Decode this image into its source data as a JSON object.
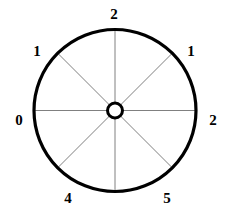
{
  "diagram": {
    "type": "radial-sector-wheel",
    "colors": {
      "background": "#ffffff",
      "outer_circle_stroke": "#000000",
      "spoke_stroke": "#808080",
      "hub_stroke": "#000000",
      "hub_fill": "#ffffff",
      "label_color": "#000000"
    },
    "geometry": {
      "center_x": 115,
      "center_y": 110.5,
      "outer_radius": 81,
      "outer_stroke_width": 3.2,
      "hub_radius": 7.5,
      "hub_stroke_width": 3,
      "spoke_stroke_width": 1,
      "spoke_count": 8,
      "spoke_angles_deg": [
        0,
        45,
        90,
        135,
        180,
        225,
        270,
        315
      ]
    },
    "spokes": [
      {
        "name": "spoke-right",
        "angle_deg": 0,
        "x1": 122.5,
        "y1": 110.5,
        "x2": 196.0,
        "y2": 110.5
      },
      {
        "name": "spoke-upper-right",
        "angle_deg": 45,
        "x1": 120.3,
        "y1": 105.2,
        "x2": 172.3,
        "y2": 53.2
      },
      {
        "name": "spoke-top",
        "angle_deg": 90,
        "x1": 115.0,
        "y1": 103.0,
        "x2": 115.0,
        "y2": 30.0
      },
      {
        "name": "spoke-upper-left",
        "angle_deg": 135,
        "x1": 109.7,
        "y1": 105.2,
        "x2": 57.7,
        "y2": 53.2
      },
      {
        "name": "spoke-left",
        "angle_deg": 180,
        "x1": 107.5,
        "y1": 110.5,
        "x2": 34.0,
        "y2": 110.5
      },
      {
        "name": "spoke-lower-left",
        "angle_deg": 225,
        "x1": 109.7,
        "y1": 115.8,
        "x2": 57.7,
        "y2": 167.8
      },
      {
        "name": "spoke-bottom",
        "angle_deg": 270,
        "x1": 115.0,
        "y1": 118.0,
        "x2": 115.0,
        "y2": 191.0
      },
      {
        "name": "spoke-lower-right",
        "angle_deg": 315,
        "x1": 120.3,
        "y1": 115.8,
        "x2": 172.3,
        "y2": 167.8
      }
    ],
    "labels": [
      {
        "name": "label-left",
        "text": "0",
        "angle_deg": 180,
        "x": 19,
        "y": 120
      },
      {
        "name": "label-upper-left",
        "text": "1",
        "angle_deg": 135,
        "x": 37,
        "y": 51
      },
      {
        "name": "label-top",
        "text": "2",
        "angle_deg": 90,
        "x": 114,
        "y": 14
      },
      {
        "name": "label-upper-right",
        "text": "1",
        "angle_deg": 45,
        "x": 191,
        "y": 51
      },
      {
        "name": "label-right",
        "text": "2",
        "angle_deg": 0,
        "x": 213,
        "y": 120
      },
      {
        "name": "label-lower-left",
        "text": "4",
        "angle_deg": 225,
        "x": 68,
        "y": 198
      },
      {
        "name": "label-lower-right",
        "text": "5",
        "angle_deg": 315,
        "x": 167,
        "y": 198
      }
    ]
  }
}
